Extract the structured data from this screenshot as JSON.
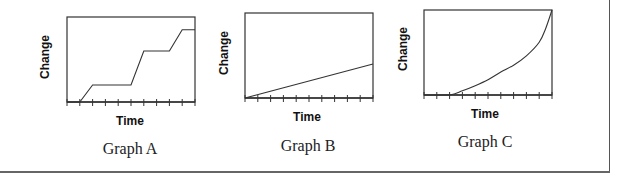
{
  "chart_data": [
    {
      "type": "line",
      "title": "Graph A",
      "xlabel": "Time",
      "ylabel": "Change",
      "grid": false,
      "x_ticks": 10,
      "ylim": [
        0,
        100
      ],
      "x": [
        0,
        1,
        2,
        5,
        6,
        8,
        9,
        10
      ],
      "values": [
        0,
        0,
        20,
        20,
        60,
        60,
        85,
        85
      ],
      "description": "Step-like increase: flat, rise, plateau, rise, plateau, rise, plateau"
    },
    {
      "type": "line",
      "title": "Graph B",
      "xlabel": "Time",
      "ylabel": "Change",
      "grid": false,
      "x_ticks": 10,
      "ylim": [
        0,
        100
      ],
      "x": [
        0,
        10
      ],
      "values": [
        0,
        40
      ],
      "description": "Constant linear increase"
    },
    {
      "type": "line",
      "title": "Graph C",
      "xlabel": "Time",
      "ylabel": "Change",
      "grid": false,
      "x_ticks": 10,
      "ylim": [
        0,
        100
      ],
      "x": [
        0,
        2,
        3,
        4,
        5,
        6,
        7,
        8,
        9,
        9.5,
        10
      ],
      "values": [
        0,
        0,
        5,
        11,
        18,
        27,
        35,
        46,
        62,
        78,
        100
      ],
      "description": "Flat then accelerating (exponential-like) increase"
    }
  ],
  "graphs": [
    {
      "caption": "Graph A",
      "xlabel": "Time",
      "ylabel": "Change"
    },
    {
      "caption": "Graph B",
      "xlabel": "Time",
      "ylabel": "Change"
    },
    {
      "caption": "Graph C",
      "xlabel": "Time",
      "ylabel": "Change"
    }
  ],
  "colors": {
    "line": "#333333",
    "axis": "#333333",
    "frame": "#555555"
  }
}
